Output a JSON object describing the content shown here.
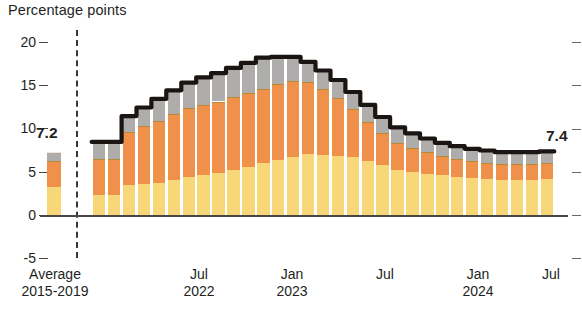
{
  "chart_data": {
    "type": "bar",
    "title": "",
    "ylabel": "Percentage points",
    "xlabel": "",
    "ylim": [
      -5,
      20
    ],
    "yticks": [
      20,
      15,
      10,
      5,
      0,
      -5
    ],
    "ytick_labels": [
      "20",
      "15",
      "10",
      "5",
      "0",
      "-5"
    ],
    "grid": false,
    "legend": "none",
    "stacked": true,
    "categories": [
      "Average 2015-2019",
      "Jan 2022",
      "Feb 2022",
      "Mar 2022",
      "Apr 2022",
      "May 2022",
      "Jun 2022",
      "Jul 2022",
      "Aug 2022",
      "Sep 2022",
      "Oct 2022",
      "Nov 2022",
      "Dec 2022",
      "Jan 2023",
      "Feb 2023",
      "Mar 2023",
      "Apr 2023",
      "May 2023",
      "Jun 2023",
      "Jul 2023",
      "Aug 2023",
      "Sep 2023",
      "Oct 2023",
      "Nov 2023",
      "Dec 2023",
      "Jan 2024",
      "Feb 2024",
      "Mar 2024",
      "Apr 2024",
      "May 2024",
      "Jun 2024",
      "Jul 2024"
    ],
    "series": [
      {
        "name": "bottom-segment",
        "color": "#f7d778",
        "values": [
          3.3,
          2.3,
          2.3,
          3.5,
          3.6,
          3.7,
          4.1,
          4.4,
          4.6,
          4.9,
          5.2,
          5.6,
          6.0,
          6.4,
          6.8,
          7.1,
          7.0,
          6.9,
          6.7,
          6.3,
          5.8,
          5.2,
          5.0,
          4.8,
          4.6,
          4.4,
          4.3,
          4.2,
          4.1,
          4.1,
          4.1,
          4.2
        ]
      },
      {
        "name": "middle-segment",
        "color": "#f0914b",
        "values": [
          3.0,
          4.2,
          4.2,
          6.1,
          6.7,
          7.2,
          7.6,
          8.0,
          8.2,
          8.3,
          8.5,
          8.6,
          8.7,
          8.8,
          8.8,
          8.4,
          7.6,
          6.7,
          5.6,
          4.5,
          3.7,
          3.2,
          2.8,
          2.5,
          2.3,
          2.1,
          2.0,
          1.9,
          1.8,
          1.8,
          1.8,
          1.8
        ]
      },
      {
        "name": "top-segment",
        "color": "#aeadab",
        "values": [
          0.9,
          2.0,
          2.0,
          1.9,
          2.2,
          2.6,
          2.8,
          3.0,
          3.2,
          3.3,
          3.4,
          3.5,
          3.6,
          3.2,
          2.8,
          2.3,
          2.2,
          2.1,
          2.0,
          2.0,
          1.9,
          1.8,
          1.7,
          1.6,
          1.5,
          1.5,
          1.4,
          1.4,
          1.4,
          1.4,
          1.4,
          1.4
        ]
      }
    ],
    "totals": [
      7.2,
      8.5,
      8.5,
      11.5,
      12.5,
      13.5,
      14.5,
      15.4,
      16.0,
      16.5,
      17.1,
      17.7,
      18.3,
      18.4,
      18.4,
      17.8,
      16.8,
      15.7,
      14.3,
      12.8,
      11.4,
      10.2,
      9.5,
      8.9,
      8.4,
      8.0,
      7.7,
      7.5,
      7.3,
      7.3,
      7.3,
      7.4
    ],
    "total_line": {
      "name": "total",
      "color": "#1a1513"
    },
    "annotations": [
      {
        "label": "7.2",
        "at": "Average 2015-2019"
      },
      {
        "label": "7.4",
        "at": "Jul 2024"
      }
    ],
    "xtick_labels": [
      {
        "line1": "Average",
        "line2": "2015-2019"
      },
      {
        "line1": "Jul",
        "line2": "2022"
      },
      {
        "line1": "Jan",
        "line2": "2023"
      },
      {
        "line1": "Jul",
        "line2": ""
      },
      {
        "line1": "Jan",
        "line2": "2024"
      },
      {
        "line1": "Jul",
        "line2": ""
      }
    ]
  }
}
